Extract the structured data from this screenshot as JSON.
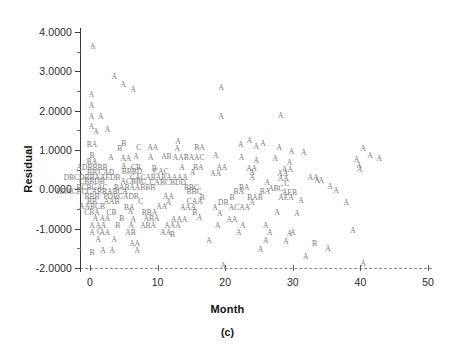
{
  "figure": {
    "caption": "(c)",
    "marker_note": "A",
    "colors": {
      "axis": "#3a3a3a",
      "grid_dash": "#8a8a8a",
      "marker": "#787878",
      "text": "#111111",
      "background": "#ffffff"
    }
  },
  "chart_data": {
    "type": "scatter",
    "title": "",
    "subtitle": "",
    "caption": "(c)",
    "xlabel": "Month",
    "ylabel": "Residual",
    "xlim": [
      -2,
      52
    ],
    "ylim": [
      -2.3,
      4.35
    ],
    "xticks": [
      0,
      10,
      20,
      30,
      40,
      50
    ],
    "xticklabels": [
      "0",
      "10",
      "20",
      "30",
      "40",
      "50"
    ],
    "yticks": [
      4.0,
      3.0,
      2.0,
      1.0,
      0.0,
      -1.0,
      -2.0
    ],
    "yticklabels": [
      "4.0000",
      "3.0000",
      "2.0000",
      "1.0000",
      "0.0000",
      "-1.0000",
      "-2.0000"
    ],
    "grid": false,
    "legend": null,
    "marker_encoding": {
      "description": "Letter markers denote number of coincident observations",
      "A": 1,
      "B": 2,
      "C": 3,
      "D": 4
    },
    "points": [
      {
        "x": 0.4,
        "y": 3.62,
        "m": "A"
      },
      {
        "x": 3.6,
        "y": 2.85,
        "m": "A"
      },
      {
        "x": 4.9,
        "y": 2.66,
        "m": "A"
      },
      {
        "x": 6.4,
        "y": 2.53,
        "m": "A"
      },
      {
        "x": 19.4,
        "y": 2.58,
        "m": "A"
      },
      {
        "x": 0.2,
        "y": 2.4,
        "m": "A"
      },
      {
        "x": 0.2,
        "y": 2.13,
        "m": "A"
      },
      {
        "x": 0.2,
        "y": 1.85,
        "m": "A"
      },
      {
        "x": 1.6,
        "y": 1.84,
        "m": "A"
      },
      {
        "x": 19.4,
        "y": 1.85,
        "m": "A"
      },
      {
        "x": 28.2,
        "y": 1.86,
        "m": "A"
      },
      {
        "x": 0.2,
        "y": 1.58,
        "m": "A"
      },
      {
        "x": 0.9,
        "y": 1.45,
        "m": "A"
      },
      {
        "x": 2.6,
        "y": 1.5,
        "m": "A"
      },
      {
        "x": 0.3,
        "y": 1.13,
        "m": "BA"
      },
      {
        "x": 5.0,
        "y": 1.16,
        "m": "B"
      },
      {
        "x": 4.4,
        "y": 1.03,
        "m": "B"
      },
      {
        "x": 7.2,
        "y": 1.06,
        "m": "C"
      },
      {
        "x": 9.3,
        "y": 1.06,
        "m": "AA"
      },
      {
        "x": 13.0,
        "y": 1.2,
        "m": "A"
      },
      {
        "x": 12.9,
        "y": 1.02,
        "m": "A"
      },
      {
        "x": 16.2,
        "y": 1.05,
        "m": "BA"
      },
      {
        "x": 22.3,
        "y": 1.12,
        "m": "A"
      },
      {
        "x": 23.6,
        "y": 1.23,
        "m": "A"
      },
      {
        "x": 24.6,
        "y": 1.08,
        "m": "A"
      },
      {
        "x": 25.6,
        "y": 1.16,
        "m": "A"
      },
      {
        "x": 28.0,
        "y": 1.05,
        "m": "A"
      },
      {
        "x": 40.4,
        "y": 1.03,
        "m": "A"
      },
      {
        "x": 41.4,
        "y": 0.86,
        "m": "A"
      },
      {
        "x": 42.8,
        "y": 0.76,
        "m": "A"
      },
      {
        "x": 0.3,
        "y": 0.84,
        "m": "B"
      },
      {
        "x": 0.3,
        "y": 0.7,
        "m": "BA"
      },
      {
        "x": 3.1,
        "y": 0.8,
        "m": "A"
      },
      {
        "x": 5.3,
        "y": 0.76,
        "m": "AA"
      },
      {
        "x": 6.8,
        "y": 0.82,
        "m": "A"
      },
      {
        "x": 9.0,
        "y": 0.79,
        "m": "A"
      },
      {
        "x": 11.3,
        "y": 0.83,
        "m": "AB"
      },
      {
        "x": 14.6,
        "y": 0.79,
        "m": "AABAAC"
      },
      {
        "x": 18.6,
        "y": 0.85,
        "m": "A"
      },
      {
        "x": 22.4,
        "y": 0.8,
        "m": "A"
      },
      {
        "x": 24.6,
        "y": 0.73,
        "m": "A"
      },
      {
        "x": 27.4,
        "y": 0.76,
        "m": "A"
      },
      {
        "x": 29.5,
        "y": 0.68,
        "m": "A"
      },
      {
        "x": 39.4,
        "y": 0.74,
        "m": "A"
      },
      {
        "x": 0.3,
        "y": 0.55,
        "m": "ADBBBB"
      },
      {
        "x": 5.0,
        "y": 0.56,
        "m": "A"
      },
      {
        "x": 6.8,
        "y": 0.55,
        "m": "CB"
      },
      {
        "x": 9.5,
        "y": 0.52,
        "m": "B"
      },
      {
        "x": 13.6,
        "y": 0.55,
        "m": "A"
      },
      {
        "x": 16.0,
        "y": 0.54,
        "m": "BA"
      },
      {
        "x": 19.5,
        "y": 0.53,
        "m": "AA"
      },
      {
        "x": 23.9,
        "y": 0.52,
        "m": "AA"
      },
      {
        "x": 29.2,
        "y": 0.5,
        "m": "AA"
      },
      {
        "x": 0.3,
        "y": 0.42,
        "m": "BB"
      },
      {
        "x": 2.4,
        "y": 0.41,
        "m": "CAD"
      },
      {
        "x": 6.2,
        "y": 0.43,
        "m": "BBBD"
      },
      {
        "x": 10.5,
        "y": 0.44,
        "m": "CAC"
      },
      {
        "x": 15.2,
        "y": 0.42,
        "m": "A"
      },
      {
        "x": 18.6,
        "y": 0.4,
        "m": "AA"
      },
      {
        "x": 24.0,
        "y": 0.41,
        "m": "A"
      },
      {
        "x": 28.5,
        "y": 0.38,
        "m": "AA"
      },
      {
        "x": 0.3,
        "y": 0.3,
        "m": "DBCDBBAAEDB"
      },
      {
        "x": 10.2,
        "y": 0.3,
        "m": "CACABABAAAA"
      },
      {
        "x": 24.0,
        "y": 0.29,
        "m": "A"
      },
      {
        "x": 28.6,
        "y": 0.26,
        "m": "AA"
      },
      {
        "x": 0.3,
        "y": 0.18,
        "m": "CBBDB"
      },
      {
        "x": 6.4,
        "y": 0.18,
        "m": "ACBBC"
      },
      {
        "x": 11.5,
        "y": 0.17,
        "m": "CABCBDD"
      },
      {
        "x": 26.2,
        "y": 0.16,
        "m": "A"
      },
      {
        "x": 29.1,
        "y": 0.14,
        "m": "C"
      },
      {
        "x": 0.3,
        "y": 0.04,
        "m": "BCBGAC"
      },
      {
        "x": 6.6,
        "y": 0.04,
        "m": "BABAABBB"
      },
      {
        "x": 15.0,
        "y": 0.04,
        "m": "BBC"
      },
      {
        "x": 22.8,
        "y": 0.03,
        "m": "BA"
      },
      {
        "x": 27.5,
        "y": 0.02,
        "m": "ABC"
      },
      {
        "x": 0.3,
        "y": -0.08,
        "m": "BBACBCCABBABCA"
      },
      {
        "x": 15.4,
        "y": -0.08,
        "m": "BBC"
      },
      {
        "x": 22.0,
        "y": -0.07,
        "m": "BA"
      },
      {
        "x": 25.9,
        "y": -0.08,
        "m": "BA"
      },
      {
        "x": 29.5,
        "y": -0.09,
        "m": "AEB"
      },
      {
        "x": 0.3,
        "y": -0.2,
        "m": "BBB"
      },
      {
        "x": 4.6,
        "y": -0.2,
        "m": "PDBCADB"
      },
      {
        "x": 11.6,
        "y": -0.2,
        "m": "AA"
      },
      {
        "x": 16.6,
        "y": -0.21,
        "m": "B"
      },
      {
        "x": 21.0,
        "y": -0.21,
        "m": "B"
      },
      {
        "x": 24.4,
        "y": -0.22,
        "m": "BAB"
      },
      {
        "x": 29.0,
        "y": -0.23,
        "m": "AEA"
      },
      {
        "x": 0.3,
        "y": -0.33,
        "m": "BB"
      },
      {
        "x": 3.2,
        "y": -0.33,
        "m": "AAB"
      },
      {
        "x": 7.5,
        "y": -0.32,
        "m": "C"
      },
      {
        "x": 11.6,
        "y": -0.34,
        "m": "A"
      },
      {
        "x": 15.5,
        "y": -0.33,
        "m": "CAA"
      },
      {
        "x": 19.7,
        "y": -0.34,
        "m": "DB"
      },
      {
        "x": 24.0,
        "y": -0.35,
        "m": "A"
      },
      {
        "x": 0.3,
        "y": -0.46,
        "m": "AABCB"
      },
      {
        "x": 5.8,
        "y": -0.47,
        "m": "BA"
      },
      {
        "x": 10.6,
        "y": -0.46,
        "m": "AA"
      },
      {
        "x": 14.5,
        "y": -0.48,
        "m": "AAA"
      },
      {
        "x": 18.5,
        "y": -0.47,
        "m": "A"
      },
      {
        "x": 22.1,
        "y": -0.48,
        "m": "ACAA"
      },
      {
        "x": 0.3,
        "y": -0.6,
        "m": "CBA"
      },
      {
        "x": 3.2,
        "y": -0.6,
        "m": "CB"
      },
      {
        "x": 6.0,
        "y": -0.58,
        "m": "A"
      },
      {
        "x": 8.8,
        "y": -0.61,
        "m": "BBA"
      },
      {
        "x": 15.5,
        "y": -0.6,
        "m": "B"
      },
      {
        "x": 19.2,
        "y": -0.62,
        "m": "A"
      },
      {
        "x": 27.7,
        "y": -0.6,
        "m": "A"
      },
      {
        "x": 0.8,
        "y": -0.75,
        "m": "A"
      },
      {
        "x": 2.2,
        "y": -0.75,
        "m": "AA"
      },
      {
        "x": 4.7,
        "y": -0.76,
        "m": "B"
      },
      {
        "x": 6.4,
        "y": -0.77,
        "m": "A"
      },
      {
        "x": 9.1,
        "y": -0.75,
        "m": "ABA"
      },
      {
        "x": 13.2,
        "y": -0.78,
        "m": "AAA"
      },
      {
        "x": 16.2,
        "y": -0.72,
        "m": "A"
      },
      {
        "x": 21.0,
        "y": -0.78,
        "m": "AA"
      },
      {
        "x": 0.3,
        "y": -0.92,
        "m": "A"
      },
      {
        "x": 1.6,
        "y": -0.92,
        "m": "AA"
      },
      {
        "x": 4.1,
        "y": -0.93,
        "m": "B"
      },
      {
        "x": 6.1,
        "y": -0.92,
        "m": "A"
      },
      {
        "x": 8.6,
        "y": -0.92,
        "m": "ABA"
      },
      {
        "x": 12.2,
        "y": -0.92,
        "m": "AAA"
      },
      {
        "x": 18.9,
        "y": -0.92,
        "m": "A"
      },
      {
        "x": 22.6,
        "y": -0.92,
        "m": "A"
      },
      {
        "x": 26.0,
        "y": -0.93,
        "m": "A"
      },
      {
        "x": 0.3,
        "y": -1.12,
        "m": "A"
      },
      {
        "x": 1.4,
        "y": -1.08,
        "m": "C"
      },
      {
        "x": 2.2,
        "y": -1.12,
        "m": "AA"
      },
      {
        "x": 6.0,
        "y": -1.1,
        "m": "AB"
      },
      {
        "x": 11.2,
        "y": -1.1,
        "m": "AA"
      },
      {
        "x": 12.2,
        "y": -1.15,
        "m": "B"
      },
      {
        "x": 22.0,
        "y": -1.12,
        "m": "A"
      },
      {
        "x": 26.6,
        "y": -1.1,
        "m": "A"
      },
      {
        "x": 29.5,
        "y": -1.13,
        "m": "A"
      },
      {
        "x": 1.2,
        "y": -1.3,
        "m": "A"
      },
      {
        "x": 3.6,
        "y": -1.3,
        "m": "A"
      },
      {
        "x": 17.6,
        "y": -1.32,
        "m": "A"
      },
      {
        "x": 26.0,
        "y": -1.32,
        "m": "A"
      },
      {
        "x": 29.0,
        "y": -1.35,
        "m": "A"
      },
      {
        "x": 6.6,
        "y": -1.38,
        "m": "AA"
      },
      {
        "x": 33.2,
        "y": -1.4,
        "m": "B"
      },
      {
        "x": 0.3,
        "y": -1.62,
        "m": "B"
      },
      {
        "x": 1.9,
        "y": -1.58,
        "m": "A"
      },
      {
        "x": 3.3,
        "y": -1.58,
        "m": "A"
      },
      {
        "x": 7.0,
        "y": -1.58,
        "m": "A"
      },
      {
        "x": 35.2,
        "y": -1.52,
        "m": "A"
      },
      {
        "x": 19.7,
        "y": -1.95,
        "m": "A"
      },
      {
        "x": 40.4,
        "y": -1.9,
        "m": "A"
      },
      {
        "x": 31.6,
        "y": 0.93,
        "m": "A"
      },
      {
        "x": 33.6,
        "y": 0.22,
        "m": "A"
      },
      {
        "x": 35.5,
        "y": 0.05,
        "m": "A"
      },
      {
        "x": 36.4,
        "y": -0.05,
        "m": "A"
      },
      {
        "x": 37.9,
        "y": -0.35,
        "m": "A"
      },
      {
        "x": 31.2,
        "y": -0.3,
        "m": "A"
      },
      {
        "x": 33.0,
        "y": 0.3,
        "m": "AA"
      },
      {
        "x": 34.2,
        "y": 0.22,
        "m": "A"
      },
      {
        "x": 39.8,
        "y": 0.6,
        "m": "A"
      },
      {
        "x": 39.9,
        "y": 0.48,
        "m": "A"
      },
      {
        "x": 38.9,
        "y": -1.05,
        "m": "A"
      },
      {
        "x": 31.9,
        "y": -1.72,
        "m": "A"
      },
      {
        "x": 29.8,
        "y": 0.94,
        "m": "A"
      },
      {
        "x": 30.6,
        "y": -0.62,
        "m": "A"
      },
      {
        "x": 30.0,
        "y": -1.1,
        "m": "A"
      },
      {
        "x": 25.2,
        "y": -1.55,
        "m": "A"
      }
    ]
  }
}
